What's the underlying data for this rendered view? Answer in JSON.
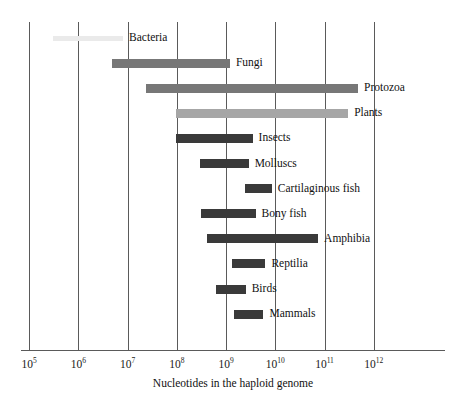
{
  "chart_data": {
    "type": "bar",
    "orientation": "horizontal",
    "title": "",
    "xlabel": "Nucleotides in the haploid genome",
    "ylabel": "",
    "xscale": "log",
    "xlim": [
      100000,
      10000000000000.0
    ],
    "grid": true,
    "legend": "none",
    "xticks": [
      {
        "value": 100000,
        "base": "10",
        "exponent": "5",
        "label": "10^5"
      },
      {
        "value": 1000000,
        "base": "10",
        "exponent": "6",
        "label": "10^6"
      },
      {
        "value": 10000000,
        "base": "10",
        "exponent": "7",
        "label": "10^7"
      },
      {
        "value": 100000000,
        "base": "10",
        "exponent": "8",
        "label": "10^8"
      },
      {
        "value": 1000000000,
        "base": "10",
        "exponent": "9",
        "label": "10^9"
      },
      {
        "value": 10000000000,
        "base": "10",
        "exponent": "10",
        "label": "10^10"
      },
      {
        "value": 100000000000,
        "base": "10",
        "exponent": "11",
        "label": "10^11"
      },
      {
        "value": 1000000000000,
        "base": "10",
        "exponent": "12",
        "label": "10^12"
      }
    ],
    "categories": [
      "Bacteria",
      "Fungi",
      "Protozoa",
      "Plants",
      "Insects",
      "Molluscs",
      "Cartilaginous fish",
      "Bony fish",
      "Amphibia",
      "Reptilia",
      "Birds",
      "Mammals"
    ],
    "ranges": [
      {
        "name": "Bacteria",
        "log_min": 5.49,
        "log_max": 6.91,
        "min": 310000.0,
        "max": 8100000.0,
        "color": "#eaeaea",
        "thickness": 5
      },
      {
        "name": "Fungi",
        "log_min": 6.69,
        "log_max": 9.08,
        "min": 4900000.0,
        "max": 1200000000.0,
        "color": "#777777",
        "thickness": 9
      },
      {
        "name": "Protozoa",
        "log_min": 7.38,
        "log_max": 11.68,
        "min": 24000000.0,
        "max": 480000000000.0,
        "color": "#777777",
        "thickness": 9
      },
      {
        "name": "Plants",
        "log_min": 7.99,
        "log_max": 11.48,
        "min": 98000000.0,
        "max": 300000000000.0,
        "color": "#a6a6a6",
        "thickness": 9
      },
      {
        "name": "Insects",
        "log_min": 7.99,
        "log_max": 9.54,
        "min": 98000000.0,
        "max": 3500000000.0,
        "color": "#3a3a3a",
        "thickness": 9
      },
      {
        "name": "Molluscs",
        "log_min": 8.48,
        "log_max": 9.46,
        "min": 300000000.0,
        "max": 2900000000.0,
        "color": "#3a3a3a",
        "thickness": 9
      },
      {
        "name": "Cartilaginous fish",
        "log_min": 9.38,
        "log_max": 9.93,
        "min": 2400000000.0,
        "max": 8500000000.0,
        "color": "#3a3a3a",
        "thickness": 9
      },
      {
        "name": "Bony fish",
        "log_min": 8.5,
        "log_max": 9.6,
        "min": 320000000.0,
        "max": 4000000000.0,
        "color": "#3a3a3a",
        "thickness": 9
      },
      {
        "name": "Amphibia",
        "log_min": 8.62,
        "log_max": 10.87,
        "min": 420000000.0,
        "max": 74000000000.0,
        "color": "#3a3a3a",
        "thickness": 9
      },
      {
        "name": "Reptilia",
        "log_min": 9.13,
        "log_max": 9.8,
        "min": 1300000000.0,
        "max": 6300000000.0,
        "color": "#3a3a3a",
        "thickness": 9
      },
      {
        "name": "Birds",
        "log_min": 8.8,
        "log_max": 9.4,
        "min": 630000000.0,
        "max": 2500000000.0,
        "color": "#3a3a3a",
        "thickness": 9
      },
      {
        "name": "Mammals",
        "log_min": 9.17,
        "log_max": 9.76,
        "min": 1500000000.0,
        "max": 5800000000.0,
        "color": "#3a3a3a",
        "thickness": 9
      }
    ]
  },
  "axis": {
    "x_title": "Nucleotides in the haploid genome"
  },
  "labels": {
    "bacteria": "Bacteria",
    "fungi": "Fungi",
    "protozoa": "Protozoa",
    "plants": "Plants",
    "insects": "Insects",
    "molluscs": "Molluscs",
    "cartilaginous_fish": "Cartilaginous fish",
    "bony_fish": "Bony fish",
    "amphibia": "Amphibia",
    "reptilia": "Reptilia",
    "birds": "Birds",
    "mammals": "Mammals"
  },
  "colors": {
    "dark_bar": "#3a3a3a",
    "mid_bar": "#777777",
    "light_bar": "#a6a6a6",
    "pale_bar": "#eaeaea",
    "axis": "#5a5a5a",
    "text": "#111111",
    "background": "#ffffff"
  }
}
